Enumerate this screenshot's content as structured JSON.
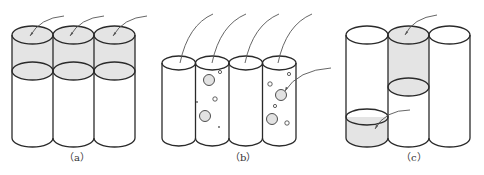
{
  "figure": {
    "panels": [
      {
        "id": "a",
        "caption": "（a）",
        "description": "Three cylinders; upper section shaded (fluid filled) above an interface ellipse",
        "cylinder_count": 3,
        "leader_count": 3
      },
      {
        "id": "b",
        "caption": "（b）",
        "description": "Four cylinders; second and fourth contain dispersed bubbles",
        "cylinder_count": 4,
        "leader_count": 5
      },
      {
        "id": "c",
        "caption": "（c）",
        "description": "Three cylinders; middle shaded from top to interface, left shaded at bottom section",
        "cylinder_count": 3,
        "leader_count": 2
      }
    ],
    "colors": {
      "line": "#2a2a2a",
      "shade": "#e4e4e4",
      "leader": "#555555",
      "background": "#ffffff"
    }
  }
}
